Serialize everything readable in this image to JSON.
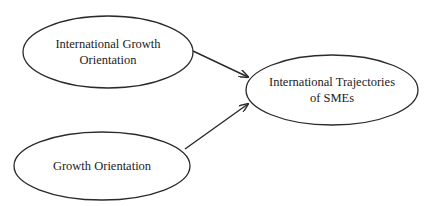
{
  "diagram": {
    "type": "conceptual-model",
    "nodes": [
      {
        "id": "igo",
        "label_line1": "International Growth",
        "label_line2": "Orientation",
        "shape": "ellipse",
        "cx": 108,
        "cy": 52,
        "rx": 85,
        "ry": 36
      },
      {
        "id": "go",
        "label_line1": "Growth Orientation",
        "label_line2": "",
        "shape": "ellipse",
        "cx": 102,
        "cy": 166,
        "rx": 88,
        "ry": 34
      },
      {
        "id": "its",
        "label_line1": "International Trajectories",
        "label_line2": "of SMEs",
        "shape": "ellipse",
        "cx": 332,
        "cy": 90,
        "rx": 86,
        "ry": 35
      }
    ],
    "edges": [
      {
        "from": "igo",
        "to": "its",
        "x1": 193,
        "y1": 51,
        "x2": 249,
        "y2": 77
      },
      {
        "from": "go",
        "to": "its",
        "x1": 185,
        "y1": 149,
        "x2": 249,
        "y2": 104
      }
    ],
    "colors": {
      "stroke": "#2a2a2a",
      "text": "#222222",
      "background": "#ffffff"
    }
  }
}
